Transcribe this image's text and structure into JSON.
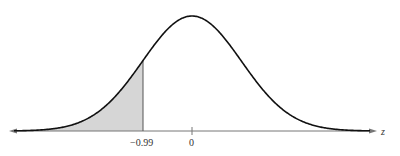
{
  "chart_data": {
    "type": "area",
    "title": "",
    "xlabel": "z",
    "ylabel": "",
    "ticks": [
      {
        "value": -0.99,
        "label": "−0.99"
      },
      {
        "value": 0,
        "label": "0"
      }
    ],
    "shaded_region": {
      "from": "-inf",
      "to": -0.99,
      "color": "#d4d4d4"
    },
    "curve": {
      "mean": 0,
      "sd": 1,
      "color": "#111111"
    },
    "grid": false
  },
  "labels": {
    "axis_name": "z",
    "tick_neg": "−0.99",
    "tick_zero": "0"
  }
}
